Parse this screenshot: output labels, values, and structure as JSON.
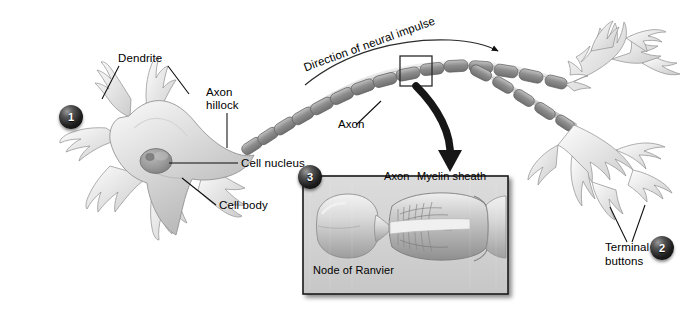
{
  "figure": {
    "background_color": "#ffffff",
    "ink_color": "#000000"
  },
  "labels": {
    "dendrite": "Dendrite",
    "axon_hillock_line1": "Axon",
    "axon_hillock_line2": "hillock",
    "cell_nucleus": "Cell nucleus",
    "cell_body": "Cell body",
    "direction_of_neural_impulse": "Direction of neural impulse",
    "axon": "Axon",
    "terminal_buttons_line1": "Terminal",
    "terminal_buttons_line2": "buttons"
  },
  "inset": {
    "axon": "Axon",
    "myelin_sheath": "Myelin sheath",
    "node_of_ranvier": "Node of Ranvier",
    "panel_color": "#d8d8d8",
    "border_color": "#1a1a1a"
  },
  "badges": [
    {
      "number": "1"
    },
    {
      "number": "2"
    },
    {
      "number": "3"
    }
  ]
}
